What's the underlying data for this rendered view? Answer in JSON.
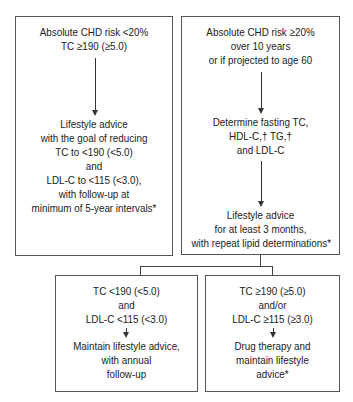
{
  "flowchart": {
    "left_top": {
      "header": [
        "Absolute CHD risk <20%",
        "TC ≥190 (≥5.0)"
      ],
      "body": [
        "Lifestyle advice",
        "with the goal of reducing",
        "TC to <190 (<5.0)",
        "and",
        "LDL-C to <115 (<3.0),",
        "with follow-up at",
        "minimum of 5-year intervals*"
      ]
    },
    "right_top": {
      "header": [
        "Absolute CHD risk ≥20%",
        "over 10 years",
        "or if projected to age 60"
      ],
      "middle": [
        "Determine fasting TC,",
        "HDL-C,† TG,†",
        "and LDL-C"
      ],
      "body": [
        "Lifestyle advice",
        "for at least 3 months,",
        "with repeat lipid determinations*"
      ]
    },
    "bottom_left": {
      "condition": [
        "TC <190 (<5.0)",
        "and",
        "LDL-C <115 (<3.0)"
      ],
      "action": [
        "Maintain lifestyle advice,",
        "with annual",
        "follow-up"
      ]
    },
    "bottom_right": {
      "condition": [
        "TC ≥190 (≥5.0)",
        "and/or",
        "LDL-C ≥115 (≥3.0)"
      ],
      "action": [
        "Drug therapy and",
        "maintain lifestyle",
        "advice*"
      ]
    }
  }
}
